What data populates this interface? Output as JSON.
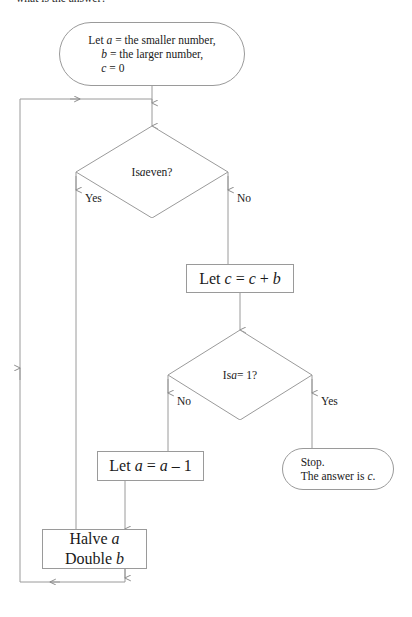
{
  "page": {
    "width": 412,
    "height": 617,
    "background": "#ffffff",
    "line_color": "#9a9a9a",
    "text_color": "#1a1a1a"
  },
  "top_caption": "what is the answer?",
  "nodes": {
    "start": {
      "shape": "terminator",
      "line1": "Let a = the smaller number,",
      "line2": "b = the larger number,",
      "line3": "c = 0"
    },
    "decision_even": {
      "shape": "decision",
      "label": "Is a even?",
      "yes_label": "Yes",
      "no_label": "No"
    },
    "add_b": {
      "shape": "process",
      "label": "Let c = c + b"
    },
    "decision_one": {
      "shape": "decision",
      "label": "Is a = 1?",
      "no_label": "No",
      "yes_label": "Yes"
    },
    "decrement_a": {
      "shape": "process",
      "label": "Let a = a – 1"
    },
    "stop": {
      "shape": "terminator",
      "line1": "Stop.",
      "line2": "The answer is c."
    },
    "halve_double": {
      "shape": "process",
      "line1": "Halve a",
      "line2": "Double b"
    }
  },
  "connectors": [
    {
      "name": "start-to-decision-even",
      "from": "start",
      "to": "decision_even",
      "arrow": true
    },
    {
      "name": "decision-even-yes",
      "from": "decision_even",
      "to": "halve_double",
      "label": "Yes",
      "arrow": true
    },
    {
      "name": "decision-even-no",
      "from": "decision_even",
      "to": "add_b",
      "label": "No",
      "arrow": true
    },
    {
      "name": "add-b-to-decision-one",
      "from": "add_b",
      "to": "decision_one",
      "arrow": true
    },
    {
      "name": "decision-one-no",
      "from": "decision_one",
      "to": "decrement_a",
      "label": "No",
      "arrow": true
    },
    {
      "name": "decision-one-yes",
      "from": "decision_one",
      "to": "stop",
      "label": "Yes",
      "arrow": true
    },
    {
      "name": "decrement-a-to-halve-double",
      "from": "decrement_a",
      "to": "halve_double",
      "arrow": true
    },
    {
      "name": "halve-double-loop-back",
      "from": "halve_double",
      "to": "decision_even",
      "arrow": true
    }
  ]
}
